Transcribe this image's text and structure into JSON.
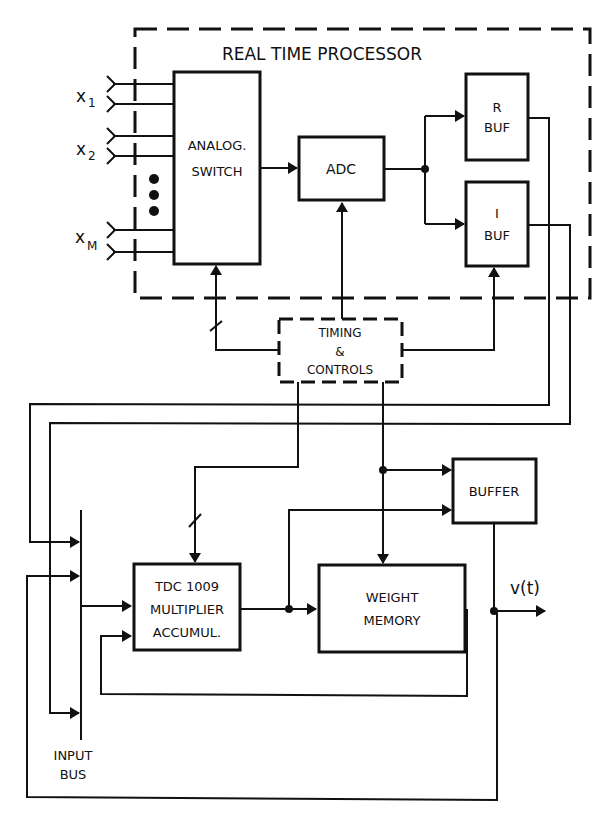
{
  "processor": {
    "title": "REAL TIME PROCESSOR"
  },
  "inputs": {
    "x1": "x",
    "x1_sub": "1",
    "x2": "x",
    "x2_sub": "2",
    "xm": "x",
    "xm_sub": "M"
  },
  "blocks": {
    "analog_switch": [
      "ANALOG.",
      "SWITCH"
    ],
    "adc": "ADC",
    "r_buf": [
      "R",
      "BUF"
    ],
    "i_buf": [
      "I",
      "BUF"
    ],
    "timing": [
      "TIMING",
      "&",
      "CONTROLS"
    ],
    "buffer": "BUFFER",
    "tdc": [
      "TDC 1009",
      "MULTIPLIER",
      "ACCUMUL."
    ],
    "weight_memory": [
      "WEIGHT",
      "MEMORY"
    ]
  },
  "output": {
    "label": "v(t)"
  },
  "input_bus": [
    "INPUT",
    "BUS"
  ],
  "colors": {
    "ink": "#111111",
    "background": "#ffffff"
  }
}
